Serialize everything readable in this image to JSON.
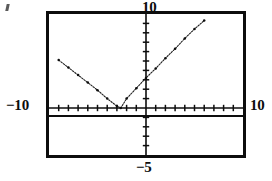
{
  "figure": {
    "kind": "graphing-calculator-viewport",
    "labels": {
      "top": "10",
      "left": "−10",
      "right": "10",
      "bottom": "−5"
    },
    "stray_mark": ""
  },
  "chart_data": {
    "type": "line",
    "title": "",
    "subtitle": "",
    "xlabel": "",
    "ylabel": "",
    "xlim": [
      -10,
      10
    ],
    "ylim": [
      -5,
      10
    ],
    "grid": false,
    "legend": null,
    "axis_tick_labels": {
      "ymax": "10",
      "xmin": "−10",
      "xmax": "10",
      "ymin": "−5"
    },
    "x_tick_interval": 1,
    "y_tick_interval": 1,
    "series": [
      {
        "name": "absolute-value-curve",
        "style": "dotted-segments",
        "x": [
          -9.0,
          -8.0,
          -7.0,
          -6.0,
          -5.0,
          -4.0,
          -3.0,
          -2.6,
          -2.0,
          -1.0,
          0.0,
          1.0,
          2.0,
          3.0,
          4.0,
          5.0,
          6.0
        ],
        "y": [
          5.1,
          4.3,
          3.5,
          2.7,
          1.9,
          1.0,
          0.2,
          0.0,
          1.0,
          2.1,
          3.2,
          4.2,
          5.3,
          6.3,
          7.4,
          8.4,
          9.3
        ]
      },
      {
        "name": "horizontal-line",
        "style": "solid",
        "x": [
          -10,
          10
        ],
        "y": [
          -0.85,
          -0.85
        ]
      }
    ],
    "annotations": [
      {
        "name": "vertex",
        "x": -2.6,
        "y": 0.0
      }
    ]
  }
}
